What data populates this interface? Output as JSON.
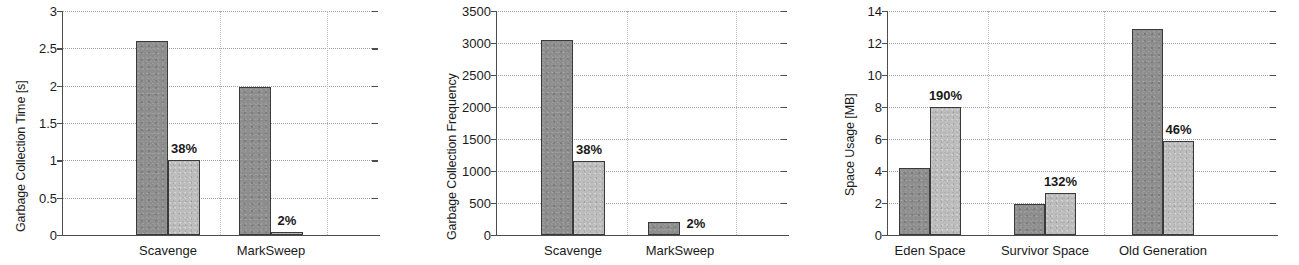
{
  "figure": {
    "panel_count": 3,
    "colors": {
      "series_before": "#8d8d8d",
      "series_after": "#bdbdbd",
      "axis": "#4d4d4d",
      "grid": "#9a9a9a",
      "text": "#1a1a1a",
      "background": "#ffffff"
    }
  },
  "chart_data": [
    {
      "type": "bar",
      "title": "",
      "xlabel": "",
      "ylabel": "Garbage Collection Time [s]",
      "categories": [
        "Scavenge",
        "MarkSweep"
      ],
      "ylim": [
        0,
        3
      ],
      "yticks": [
        0,
        0.5,
        1,
        1.5,
        2,
        2.5,
        3
      ],
      "ytick_labels": [
        "0",
        "0.5",
        "1",
        "1.5",
        "2",
        "2.5",
        "3"
      ],
      "grid": true,
      "legend": "none",
      "series": [
        {
          "name": "baseline",
          "values": [
            2.6,
            1.98
          ]
        },
        {
          "name": "optimized",
          "values": [
            1.0,
            0.04
          ]
        }
      ],
      "annotations": [
        {
          "text": "38%",
          "category": "Scavenge",
          "series": "optimized"
        },
        {
          "text": "2%",
          "category": "MarkSweep",
          "series": "optimized"
        }
      ]
    },
    {
      "type": "bar",
      "title": "",
      "xlabel": "",
      "ylabel": "Garbage Collection Frequency",
      "categories": [
        "Scavenge",
        "MarkSweep"
      ],
      "ylim": [
        0,
        3500
      ],
      "yticks": [
        0,
        500,
        1000,
        1500,
        2000,
        2500,
        3000,
        3500
      ],
      "ytick_labels": [
        "0",
        "500",
        "1000",
        "1500",
        "2000",
        "2500",
        "3000",
        "3500"
      ],
      "grid": true,
      "legend": "none",
      "series": [
        {
          "name": "baseline",
          "values": [
            3050,
            200
          ]
        },
        {
          "name": "optimized",
          "values": [
            1160,
            5
          ]
        }
      ],
      "annotations": [
        {
          "text": "38%",
          "category": "Scavenge",
          "series": "optimized"
        },
        {
          "text": "2%",
          "category": "MarkSweep",
          "series": "optimized"
        }
      ]
    },
    {
      "type": "bar",
      "title": "",
      "xlabel": "",
      "ylabel": "Space Usage [MB]",
      "categories": [
        "Eden Space",
        "Survivor Space",
        "Old Generation"
      ],
      "ylim": [
        0,
        14
      ],
      "yticks": [
        0,
        2,
        4,
        6,
        8,
        10,
        12,
        14
      ],
      "ytick_labels": [
        "0",
        "2",
        "4",
        "6",
        "8",
        "10",
        "12",
        "14"
      ],
      "grid": true,
      "legend": "none",
      "series": [
        {
          "name": "baseline",
          "values": [
            4.2,
            1.95,
            12.85
          ]
        },
        {
          "name": "optimized",
          "values": [
            8.0,
            2.6,
            5.9
          ]
        }
      ],
      "annotations": [
        {
          "text": "190%",
          "category": "Eden Space",
          "series": "optimized"
        },
        {
          "text": "132%",
          "category": "Survivor Space",
          "series": "optimized"
        },
        {
          "text": "46%",
          "category": "Old Generation",
          "series": "optimized"
        }
      ]
    }
  ]
}
